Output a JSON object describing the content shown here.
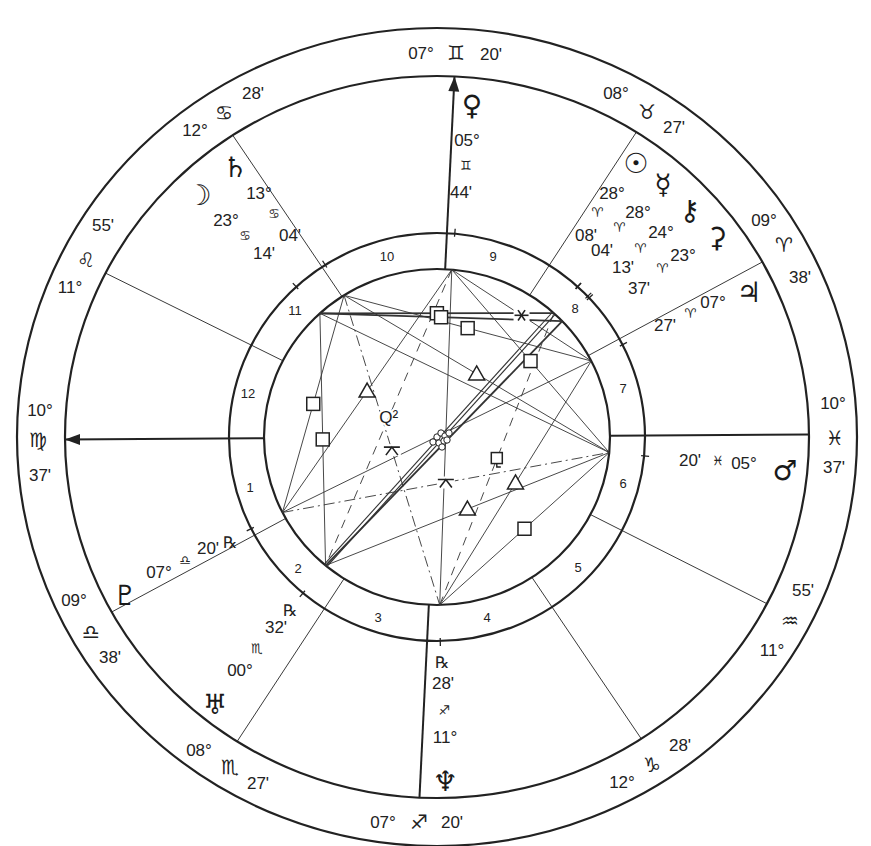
{
  "natal_chart": {
    "title": "",
    "geometry": {
      "cx": 437,
      "cy": 437,
      "rings": {
        "outer": [
          420,
          409
        ],
        "zodiac_inner": [
          372,
          361
        ],
        "house_outer": [
          208,
          204
        ],
        "house_inner": [
          173,
          168
        ]
      }
    },
    "cusps": [
      {
        "house": 1,
        "angle_label": "ASC",
        "deg": "10°",
        "sign": "♍",
        "sign_name": "Virgo",
        "min": "37'",
        "screen_angle": 180.4,
        "is_angle": true,
        "arrow": true,
        "label_pos": {
          "deg": [
            40,
            410
          ],
          "sign": [
            38,
            440
          ],
          "min": [
            40,
            475
          ]
        }
      },
      {
        "house": 2,
        "deg": "09°",
        "sign": "♎",
        "sign_name": "Libra",
        "min": "38'",
        "screen_angle": 209.0,
        "is_angle": false,
        "label_pos": {
          "deg": [
            74,
            600
          ],
          "sign": [
            91,
            632
          ],
          "min": [
            110,
            657
          ]
        }
      },
      {
        "house": 3,
        "deg": "08°",
        "sign": "♏",
        "sign_name": "Scorpio",
        "min": "27'",
        "screen_angle": 237.5,
        "is_angle": false,
        "label_pos": {
          "deg": [
            199,
            750
          ],
          "sign": [
            230,
            767
          ],
          "min": [
            258,
            783
          ]
        }
      },
      {
        "house": 4,
        "angle_label": "IC",
        "deg": "07°",
        "sign": "♐",
        "sign_name": "Sagittarius",
        "min": "20'",
        "screen_angle": 267.3,
        "is_angle": true,
        "arrow": false,
        "label_pos": {
          "deg": [
            383,
            822
          ],
          "sign": [
            419,
            822
          ],
          "min": [
            452,
            822
          ]
        }
      },
      {
        "house": 5,
        "deg": "12°",
        "sign": "♑",
        "sign_name": "Capricorn",
        "min": "28'",
        "screen_angle": 303.3,
        "is_angle": false,
        "label_pos": {
          "deg": [
            622,
            782
          ],
          "sign": [
            652,
            765
          ],
          "min": [
            680,
            745
          ]
        }
      },
      {
        "house": 6,
        "deg": "11°",
        "sign": "♒",
        "sign_name": "Aquarius",
        "min": "55'",
        "screen_angle": 332.5,
        "is_angle": false,
        "label_pos": {
          "deg": [
            772,
            650
          ],
          "sign": [
            790,
            621
          ],
          "min": [
            803,
            590
          ]
        }
      },
      {
        "house": 7,
        "angle_label": "DSC",
        "deg": "10°",
        "sign": "♓",
        "sign_name": "Pisces",
        "min": "37'",
        "screen_angle": 0.4,
        "is_angle": true,
        "arrow": false,
        "label_pos": {
          "deg": [
            833,
            403
          ],
          "sign": [
            835,
            438
          ],
          "min": [
            834,
            467
          ]
        }
      },
      {
        "house": 8,
        "deg": "09°",
        "sign": "♈",
        "sign_name": "Aries",
        "min": "38'",
        "screen_angle": 29.0,
        "is_angle": false,
        "label_pos": {
          "deg": [
            764,
            220
          ],
          "sign": [
            784,
            245
          ],
          "min": [
            800,
            277
          ]
        }
      },
      {
        "house": 9,
        "deg": "08°",
        "sign": "♉",
        "sign_name": "Taurus",
        "min": "27'",
        "screen_angle": 57.6,
        "is_angle": false,
        "label_pos": {
          "deg": [
            616,
            93
          ],
          "sign": [
            647,
            112
          ],
          "min": [
            674,
            127
          ]
        }
      },
      {
        "house": 10,
        "angle_label": "MC",
        "deg": "07°",
        "sign": "♊",
        "sign_name": "Gemini",
        "min": "20'",
        "screen_angle": 87.3,
        "is_angle": true,
        "arrow": true,
        "label_pos": {
          "deg": [
            421,
            53
          ],
          "sign": [
            456,
            53
          ],
          "min": [
            491,
            54
          ]
        }
      },
      {
        "house": 11,
        "deg": "12°",
        "sign": "♋",
        "sign_name": "Cancer",
        "min": "28'",
        "screen_angle": 123.3,
        "is_angle": false,
        "label_pos": {
          "deg": [
            195,
            130
          ],
          "sign": [
            224,
            113
          ],
          "min": [
            253,
            93
          ]
        }
      },
      {
        "house": 12,
        "deg": "11°",
        "sign": "♌",
        "sign_name": "Leo",
        "min": "55'",
        "screen_angle": 153.0,
        "is_angle": false,
        "label_pos": {
          "deg": [
            70,
            287
          ],
          "sign": [
            86,
            260
          ],
          "min": [
            103,
            225
          ]
        }
      }
    ],
    "houses": [
      {
        "num": "1",
        "pos": [
          250,
          487
        ]
      },
      {
        "num": "2",
        "pos": [
          298,
          568
        ]
      },
      {
        "num": "3",
        "pos": [
          378,
          617
        ]
      },
      {
        "num": "4",
        "pos": [
          487,
          617
        ]
      },
      {
        "num": "5",
        "pos": [
          578,
          567
        ]
      },
      {
        "num": "6",
        "pos": [
          623,
          483
        ]
      },
      {
        "num": "7",
        "pos": [
          623,
          388
        ]
      },
      {
        "num": "8",
        "pos": [
          575,
          308
        ]
      },
      {
        "num": "9",
        "pos": [
          493,
          256
        ]
      },
      {
        "num": "10",
        "pos": [
          387,
          256
        ]
      },
      {
        "num": "11",
        "pos": [
          295,
          310
        ]
      },
      {
        "num": "12",
        "pos": [
          248,
          393
        ]
      }
    ],
    "planets": [
      {
        "name": "Sun",
        "glyph": "☉",
        "deg": "28°",
        "sign": "♈",
        "min": "08'",
        "retro": "",
        "screen_angle": 47.5,
        "size": 34,
        "pos": {
          "glyph": [
            636,
            163
          ],
          "deg": [
            612,
            193
          ],
          "sign": [
            597,
            212
          ],
          "min": [
            586,
            235
          ]
        }
      },
      {
        "name": "Mercury",
        "glyph": "☿",
        "deg": "28°",
        "sign": "♈",
        "min": "04'",
        "retro": "",
        "screen_angle": 47.4,
        "size": 28,
        "pos": {
          "glyph": [
            663,
            184
          ],
          "deg": [
            638,
            212
          ],
          "sign": [
            619,
            227
          ],
          "min": [
            602,
            250
          ]
        }
      },
      {
        "name": "Chiron",
        "glyph": "⚷",
        "deg": "24°",
        "sign": "♈",
        "min": "13'",
        "retro": "",
        "screen_angle": 43.6,
        "size": 27,
        "pos": {
          "glyph": [
            690,
            210
          ],
          "deg": [
            661,
            232
          ],
          "sign": [
            640,
            248
          ],
          "min": [
            623,
            267
          ]
        }
      },
      {
        "name": "Ceres",
        "glyph": "⚳",
        "deg": "23°",
        "sign": "♈",
        "min": "37'",
        "retro": "",
        "screen_angle": 43.0,
        "size": 27,
        "pos": {
          "glyph": [
            717,
            237
          ],
          "deg": [
            683,
            255
          ],
          "sign": [
            662,
            268
          ],
          "min": [
            639,
            288
          ]
        }
      },
      {
        "name": "Jupiter",
        "glyph": "♃",
        "deg": "07°",
        "sign": "♈",
        "min": "27'",
        "retro": "",
        "screen_angle": 26.9,
        "size": 30,
        "pos": {
          "glyph": [
            749,
            292
          ],
          "deg": [
            713,
            302
          ],
          "sign": [
            690,
            313
          ],
          "min": [
            665,
            325
          ]
        }
      },
      {
        "name": "Mars",
        "glyph": "♂",
        "deg": "05°",
        "sign": "♓",
        "min": "20'",
        "retro": "",
        "screen_angle": 354.7,
        "size": 32,
        "pos": {
          "glyph": [
            785,
            470
          ],
          "deg": [
            744,
            463
          ],
          "sign": [
            718,
            460
          ],
          "min": [
            690,
            460
          ]
        }
      },
      {
        "name": "Neptune",
        "glyph": "♆",
        "deg": "11°",
        "sign": "♐",
        "min": "28'",
        "retro": "℞",
        "screen_angle": 270.9,
        "size": 30,
        "pos": {
          "glyph": [
            445,
            781
          ],
          "deg": [
            445,
            737
          ],
          "sign": [
            444,
            710
          ],
          "min": [
            443,
            683
          ],
          "retro": [
            442,
            662
          ]
        }
      },
      {
        "name": "Uranus",
        "glyph": "♅",
        "deg": "00°",
        "sign": "♏",
        "min": "32'",
        "retro": "℞",
        "screen_angle": 229.9,
        "size": 28,
        "pos": {
          "glyph": [
            215,
            704
          ],
          "deg": [
            240,
            670
          ],
          "sign": [
            257,
            648
          ],
          "min": [
            276,
            627
          ],
          "retro": [
            290,
            610
          ]
        }
      },
      {
        "name": "Pluto",
        "glyph": "♇",
        "deg": "07°",
        "sign": "♎",
        "min": "20'",
        "retro": "℞",
        "screen_angle": 206.7,
        "size": 28,
        "pos": {
          "glyph": [
            125,
            595
          ],
          "deg": [
            159,
            572
          ],
          "sign": [
            185,
            560
          ],
          "min": [
            208,
            548
          ],
          "retro": [
            230,
            542
          ]
        }
      },
      {
        "name": "Saturn",
        "glyph": "♄",
        "deg": "13°",
        "sign": "♋",
        "min": "04'",
        "retro": "",
        "screen_angle": 122.5,
        "size": 28,
        "pos": {
          "glyph": [
            235,
            167
          ],
          "deg": [
            259,
            193
          ],
          "sign": [
            274,
            213
          ],
          "min": [
            290,
            235
          ]
        }
      },
      {
        "name": "Moon",
        "glyph": "☽",
        "deg": "23°",
        "sign": "♋",
        "min": "14'",
        "retro": "",
        "screen_angle": 132.6,
        "size": 30,
        "pos": {
          "glyph": [
            199,
            195
          ],
          "deg": [
            226,
            220
          ],
          "sign": [
            245,
            235
          ],
          "min": [
            264,
            253
          ]
        }
      },
      {
        "name": "Venus",
        "glyph": "♀",
        "deg": "05°",
        "sign": "♊",
        "min": "44'",
        "retro": "",
        "screen_angle": 85.1,
        "size": 28,
        "pos": {
          "glyph": [
            472,
            105
          ],
          "deg": [
            467,
            140
          ],
          "sign": [
            466,
            165
          ],
          "min": [
            461,
            192
          ]
        }
      }
    ],
    "aspects": [
      {
        "from": "Moon",
        "to": "Sun",
        "type": "square",
        "symbol": "□",
        "style": "thick"
      },
      {
        "from": "Moon",
        "to": "Chiron",
        "type": "square",
        "symbol": "□",
        "style": "thick"
      },
      {
        "from": "Moon",
        "to": "Uranus",
        "type": "square",
        "symbol": "□",
        "style": "solid"
      },
      {
        "from": "Moon",
        "to": "Mars",
        "type": "trine",
        "symbol": "△",
        "style": "solid",
        "show_symbol": false
      },
      {
        "from": "Saturn",
        "to": "Jupiter",
        "type": "square",
        "symbol": "□",
        "style": "solid"
      },
      {
        "from": "Saturn",
        "to": "Mars",
        "type": "trine",
        "symbol": "△",
        "style": "solid"
      },
      {
        "from": "Saturn",
        "to": "Pluto",
        "type": "square",
        "symbol": "□",
        "style": "solid"
      },
      {
        "from": "Saturn",
        "to": "Neptune",
        "type": "quincunx",
        "symbol": "⚻",
        "style": "dashdot"
      },
      {
        "from": "Venus",
        "to": "Pluto",
        "type": "trine",
        "symbol": "△",
        "style": "solid"
      },
      {
        "from": "Venus",
        "to": "Uranus",
        "type": "biquintile",
        "symbol": "Q²",
        "style": "dashed"
      },
      {
        "from": "Venus",
        "to": "Neptune",
        "type": "opposition",
        "symbol": "☍",
        "style": "solid"
      },
      {
        "from": "Venus",
        "to": "Jupiter",
        "type": "sextile",
        "symbol": "✶",
        "style": "solid"
      },
      {
        "from": "Venus",
        "to": "Mars",
        "type": "square",
        "symbol": "□",
        "style": "solid"
      },
      {
        "from": "Pluto",
        "to": "Jupiter",
        "type": "opposition",
        "symbol": "☍",
        "style": "solid"
      },
      {
        "from": "Pluto",
        "to": "Mars",
        "type": "quincunx",
        "symbol": "⚻",
        "style": "dashdot"
      },
      {
        "from": "Uranus",
        "to": "Mars",
        "type": "trine",
        "symbol": "△",
        "style": "solid"
      },
      {
        "from": "Uranus",
        "to": "Sun",
        "type": "opposition",
        "symbol": "☍",
        "style": "double"
      },
      {
        "from": "Uranus",
        "to": "Chiron",
        "type": "opposition",
        "symbol": "☍",
        "style": "thick"
      },
      {
        "from": "Neptune",
        "to": "Jupiter",
        "type": "trine",
        "symbol": "△",
        "style": "solid"
      },
      {
        "from": "Neptune",
        "to": "Mars",
        "type": "square",
        "symbol": "□",
        "style": "solid"
      },
      {
        "from": "Neptune",
        "to": "Sun",
        "type": "sesquiquadrate",
        "symbol": "⚼",
        "style": "dashed"
      }
    ],
    "colors": {
      "ink": "#222222",
      "background": "#ffffff"
    }
  }
}
